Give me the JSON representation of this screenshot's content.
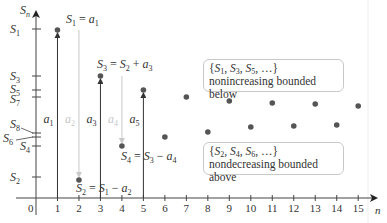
{
  "chart_data": {
    "type": "scatter",
    "title": "",
    "xlabel": "n",
    "ylabel": "S_n",
    "x_ticks": [
      "0",
      "1",
      "2",
      "3",
      "4",
      "5",
      "6",
      "7",
      "8",
      "9",
      "10",
      "11",
      "12",
      "13",
      "14",
      "15"
    ],
    "y_tick_labels": [
      "S_1",
      "S_3",
      "S_5",
      "S_7",
      "S_8",
      "S_6",
      "S_4",
      "S_2"
    ],
    "points": [
      {
        "n": 1,
        "label": "S_1",
        "py": 30
      },
      {
        "n": 2,
        "label": "S_2",
        "py": 180
      },
      {
        "n": 3,
        "label": "S_3",
        "py": 76
      },
      {
        "n": 4,
        "label": "S_4",
        "py": 146
      },
      {
        "n": 5,
        "label": "S_5",
        "py": 90
      },
      {
        "n": 6,
        "label": "S_6",
        "py": 137
      },
      {
        "n": 7,
        "label": "S_7",
        "py": 97
      },
      {
        "n": 8,
        "label": "S_8",
        "py": 132
      },
      {
        "n": 9,
        "py": 101
      },
      {
        "n": 10,
        "py": 127
      },
      {
        "n": 11,
        "py": 103
      },
      {
        "n": 12,
        "py": 126
      },
      {
        "n": 13,
        "py": 104
      },
      {
        "n": 14,
        "py": 125
      },
      {
        "n": 15,
        "py": 106
      }
    ],
    "step_arrows": [
      {
        "n": 1,
        "label": "a_1",
        "direction": "up",
        "color": "#333333"
      },
      {
        "n": 2,
        "label": "a_2",
        "direction": "down",
        "color": "#c8c8c8"
      },
      {
        "n": 3,
        "label": "a_3",
        "direction": "up",
        "color": "#333333"
      },
      {
        "n": 4,
        "label": "a_4",
        "direction": "down",
        "color": "#c8c8c8"
      },
      {
        "n": 5,
        "label": "a_5",
        "direction": "up",
        "color": "#333333"
      }
    ]
  },
  "labels": {
    "axis_y": "S",
    "axis_y_sub": "n",
    "axis_x": "n",
    "origin": "0",
    "eq1": {
      "lhs": "S",
      "lhs_sub": "1",
      "rhs": "a",
      "rhs_sub": "1"
    },
    "eq2": {
      "lhs": "S",
      "lhs_sub": "2",
      "a": "S",
      "a_sub": "1",
      "op": "−",
      "b": "a",
      "b_sub": "2"
    },
    "eq3": {
      "lhs": "S",
      "lhs_sub": "3",
      "a": "S",
      "a_sub": "2",
      "op": "+",
      "b": "a",
      "b_sub": "3"
    },
    "eq4": {
      "lhs": "S",
      "lhs_sub": "4",
      "a": "S",
      "a_sub": "3",
      "op": "−",
      "b": "a",
      "b_sub": "4"
    }
  },
  "boxes": {
    "odd": {
      "set_text": "{S1, S3, S5, …}",
      "description": "nonincreasing bounded below"
    },
    "even": {
      "set_text": "{S2, S4, S6, …}",
      "description": "nondecreasing bounded above"
    }
  },
  "colors": {
    "axis": "#444444",
    "point": "#555555",
    "arrow_dark": "#333333",
    "arrow_light": "#c8c8c8",
    "box_border": "#c9c9c9",
    "text": "#333333"
  }
}
